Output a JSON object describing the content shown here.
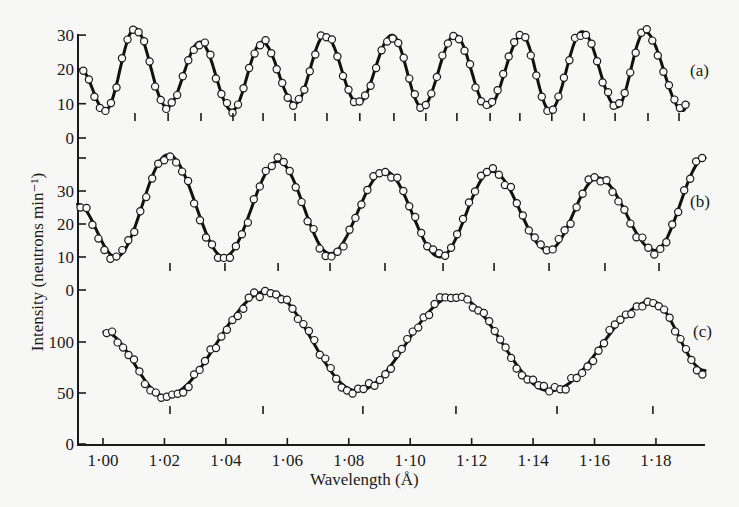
{
  "chart_data": {
    "type": "line",
    "title": "",
    "xlabel": "Wavelength  (Å)",
    "ylabel": "Intensity (neutrons min⁻¹)",
    "xlim": [
      0.992,
      1.196
    ],
    "x_ticks": [
      1.0,
      1.02,
      1.04,
      1.06,
      1.08,
      1.1,
      1.12,
      1.14,
      1.16,
      1.18
    ],
    "x_tick_labels": [
      "1·00",
      "1·02",
      "1·04",
      "1·06",
      "1·08",
      "1·10",
      "1·12",
      "1·14",
      "1·16",
      "1·18"
    ],
    "grid": false,
    "legend": "inline labels at right of each trace",
    "panels": [
      {
        "name": "(a)",
        "ylim": [
          0,
          30
        ],
        "y_ticks": [
          0,
          10,
          20,
          30
        ],
        "y_tick_labels": [
          "0",
          "10",
          "20",
          "30"
        ],
        "curve_points": [
          [
            0.9927,
            20
          ],
          [
            1.0007,
            8
          ],
          [
            1.0104,
            32
          ],
          [
            1.0208,
            9
          ],
          [
            1.0316,
            28
          ],
          [
            1.042,
            8
          ],
          [
            1.0518,
            28
          ],
          [
            1.0625,
            10
          ],
          [
            1.0723,
            30
          ],
          [
            1.083,
            10
          ],
          [
            1.0941,
            30
          ],
          [
            1.1038,
            9
          ],
          [
            1.1146,
            30
          ],
          [
            1.1253,
            9
          ],
          [
            1.1364,
            30
          ],
          [
            1.1455,
            8
          ],
          [
            1.156,
            31
          ],
          [
            1.1673,
            9
          ],
          [
            1.1764,
            31
          ],
          [
            1.1888,
            8
          ],
          [
            1.1905,
            10
          ]
        ],
        "peak_markers": [
          1.0104,
          1.0212,
          1.0319,
          1.0423,
          1.0521,
          1.0625,
          1.0729,
          1.0836,
          1.0947,
          1.1051,
          1.1152,
          1.126,
          1.1357,
          1.1461,
          1.1566,
          1.1667,
          1.1774,
          1.1875
        ]
      },
      {
        "name": "(b)",
        "ylim": [
          0,
          40
        ],
        "y_ticks": [
          0,
          10,
          20,
          30,
          40
        ],
        "y_tick_labels": [
          "0",
          "10",
          "20",
          "30",
          ""
        ],
        "curve_points": [
          [
            0.9917,
            26
          ],
          [
            1.0042,
            10
          ],
          [
            1.0212,
            41
          ],
          [
            1.0394,
            10
          ],
          [
            1.057,
            39
          ],
          [
            1.0739,
            11
          ],
          [
            1.0918,
            36
          ],
          [
            1.1097,
            10
          ],
          [
            1.1266,
            36
          ],
          [
            1.1449,
            12
          ],
          [
            1.1611,
            34
          ],
          [
            1.1797,
            12
          ],
          [
            1.196,
            40
          ]
        ],
        "peak_markers": [
          1.0218,
          1.0397,
          1.057,
          1.0739,
          1.0918,
          1.1107,
          1.1273,
          1.1452,
          1.1634,
          1.181
        ]
      },
      {
        "name": "(c)",
        "ylim": [
          0,
          150
        ],
        "y_ticks": [
          0,
          50,
          100
        ],
        "y_tick_labels": [
          "0",
          "50",
          "100"
        ],
        "curve_points": [
          [
            1.0003,
            110
          ],
          [
            1.0202,
            47
          ],
          [
            1.0537,
            150
          ],
          [
            1.0827,
            52
          ],
          [
            1.1146,
            145
          ],
          [
            1.1455,
            52
          ],
          [
            1.1787,
            140
          ],
          [
            1.196,
            72
          ]
        ],
        "peak_markers": [
          1.0218,
          1.0521,
          1.0846,
          1.1149,
          1.1478,
          1.179
        ]
      }
    ]
  },
  "labels": {
    "panel_a": "(a)",
    "panel_b": "(b)",
    "panel_c": "(c)",
    "x_axis_title": "Wavelength  (Å)",
    "y_axis_title": "Intensity (neutrons min⁻¹)"
  }
}
